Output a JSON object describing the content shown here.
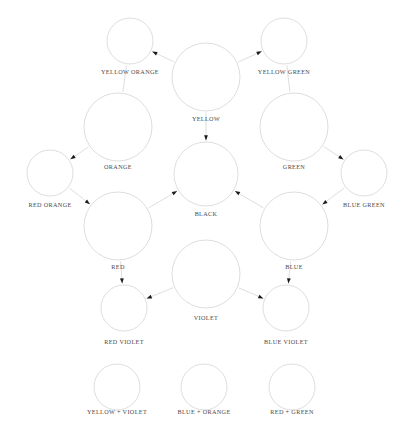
{
  "diagram": {
    "type": "color-mixing-wheel",
    "background_color": "#ffffff",
    "circle_stroke_color": "#cfcfcf",
    "line_stroke_color": "#c8c8c8",
    "arrow_color": "#1a1a1a",
    "label_color": "#4a4a4a",
    "nodes": [
      {
        "id": "yellow",
        "label": "YELLOW",
        "cx": 206,
        "cy": 77,
        "r": 34,
        "label_x": 206,
        "label_y": 119
      },
      {
        "id": "yellow_orange",
        "label": "YELLOW ORANGE",
        "cx": 130,
        "cy": 41,
        "r": 23,
        "label_x": 130,
        "label_y": 72
      },
      {
        "id": "yellow_green",
        "label": "YELLOW GREEN",
        "cx": 284,
        "cy": 41,
        "r": 23,
        "label_x": 284,
        "label_y": 72
      },
      {
        "id": "orange",
        "label": "ORANGE",
        "cx": 118,
        "cy": 127,
        "r": 34,
        "label_x": 118,
        "label_y": 167
      },
      {
        "id": "green",
        "label": "GREEN",
        "cx": 294,
        "cy": 127,
        "r": 34,
        "label_x": 294,
        "label_y": 167
      },
      {
        "id": "red_orange",
        "label": "RED ORANGE",
        "cx": 50,
        "cy": 173,
        "r": 23,
        "label_x": 50,
        "label_y": 205
      },
      {
        "id": "blue_green",
        "label": "BLUE GREEN",
        "cx": 364,
        "cy": 173,
        "r": 23,
        "label_x": 364,
        "label_y": 205
      },
      {
        "id": "black",
        "label": "BLACK",
        "cx": 206,
        "cy": 174,
        "r": 32,
        "label_x": 206,
        "label_y": 214
      },
      {
        "id": "red",
        "label": "RED",
        "cx": 118,
        "cy": 226,
        "r": 34,
        "label_x": 118,
        "label_y": 267
      },
      {
        "id": "blue",
        "label": "BLUE",
        "cx": 294,
        "cy": 226,
        "r": 34,
        "label_x": 294,
        "label_y": 267
      },
      {
        "id": "violet",
        "label": "VIOLET",
        "cx": 206,
        "cy": 274,
        "r": 34,
        "label_x": 206,
        "label_y": 318
      },
      {
        "id": "red_violet",
        "label": "RED VIOLET",
        "cx": 124,
        "cy": 308,
        "r": 23,
        "label_x": 124,
        "label_y": 342
      },
      {
        "id": "blue_violet",
        "label": "BLUE VIOLET",
        "cx": 286,
        "cy": 308,
        "r": 23,
        "label_x": 286,
        "label_y": 342
      }
    ],
    "result_nodes": [
      {
        "id": "yellow_plus_violet",
        "label": "YELLOW + VIOLET",
        "cx": 117,
        "cy": 387,
        "r": 23,
        "label_x": 117,
        "label_y": 412
      },
      {
        "id": "blue_plus_orange",
        "label": "BLUE + ORANGE",
        "cx": 204,
        "cy": 387,
        "r": 23,
        "label_x": 204,
        "label_y": 412
      },
      {
        "id": "red_plus_green",
        "label": "RED + GREEN",
        "cx": 292,
        "cy": 387,
        "r": 23,
        "label_x": 292,
        "label_y": 412
      }
    ],
    "links": [
      {
        "from": "yellow",
        "to": "yellow_orange",
        "arrow": true
      },
      {
        "from": "yellow",
        "to": "yellow_green",
        "arrow": true
      },
      {
        "from": "yellow",
        "to": "black",
        "arrow": true
      },
      {
        "from": "yellow_orange",
        "to": "orange",
        "arrow": false
      },
      {
        "from": "yellow_green",
        "to": "green",
        "arrow": false
      },
      {
        "from": "orange",
        "to": "red_orange",
        "arrow": true
      },
      {
        "from": "green",
        "to": "blue_green",
        "arrow": true
      },
      {
        "from": "red_orange",
        "to": "red",
        "arrow": true
      },
      {
        "from": "blue_green",
        "to": "blue",
        "arrow": true
      },
      {
        "from": "red",
        "to": "black",
        "arrow": true
      },
      {
        "from": "blue",
        "to": "black",
        "arrow": true
      },
      {
        "from": "red",
        "to": "red_violet",
        "arrow": true
      },
      {
        "from": "blue",
        "to": "blue_violet",
        "arrow": true
      },
      {
        "from": "violet",
        "to": "red_violet",
        "arrow": true
      },
      {
        "from": "violet",
        "to": "blue_violet",
        "arrow": true
      }
    ]
  }
}
